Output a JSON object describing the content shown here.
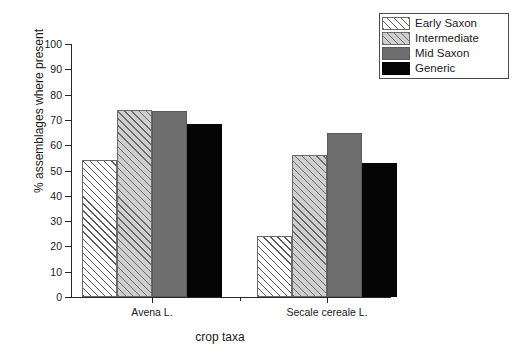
{
  "chart_data": {
    "type": "bar",
    "title": "",
    "subtitle": "",
    "xlabel": "crop taxa",
    "ylabel": "% assemblages where present",
    "categories": [
      "Avena L.",
      "Secale cereale L."
    ],
    "series": [
      {
        "name": "Early Saxon",
        "values": [
          54,
          24
        ],
        "swatch": "hatch-white"
      },
      {
        "name": "Intermediate",
        "values": [
          74,
          56
        ],
        "swatch": "hatch-gray"
      },
      {
        "name": "Mid Saxon",
        "values": [
          73.5,
          65
        ],
        "swatch": "solid-gray"
      },
      {
        "name": "Generic",
        "values": [
          68.5,
          53
        ],
        "swatch": "solid-black"
      }
    ],
    "ylim": [
      0,
      100
    ],
    "ytick_values": [
      0,
      10,
      20,
      30,
      40,
      50,
      60,
      70,
      80,
      90,
      100
    ],
    "ytick_labels": [
      "0",
      "10",
      "20",
      "30",
      "40",
      "50",
      "60",
      "70",
      "80",
      "90",
      "100"
    ],
    "grid": false,
    "legend_position": "top-right",
    "colors": {
      "series_early_saxon": "#ffffff",
      "series_intermediate": "#cfcfcf",
      "series_mid_saxon": "#6e6e6e",
      "series_generic": "#050505",
      "hatch": "#5d5d5d",
      "axis": "#272727",
      "text": "#1a1a1a",
      "background": "#ffffff"
    }
  },
  "legend": {
    "items": [
      {
        "label": "Early Saxon"
      },
      {
        "label": "Intermediate"
      },
      {
        "label": "Mid Saxon"
      },
      {
        "label": "Generic"
      }
    ]
  }
}
